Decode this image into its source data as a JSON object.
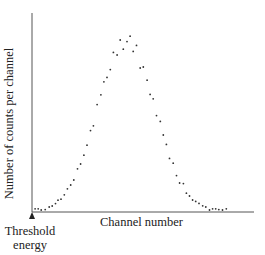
{
  "chart_data": {
    "type": "scatter",
    "title": "",
    "xlabel": "Channel number",
    "ylabel": "Number of counts per channel",
    "annotations": [
      {
        "text": "Threshold energy",
        "position": "x-axis origin",
        "marker": "up-arrow"
      }
    ],
    "grid": false,
    "legend": null,
    "xlim": [
      0,
      100
    ],
    "ylim": [
      0,
      100
    ],
    "x": [
      1.4,
      2.8,
      4.2,
      6.0,
      7.8,
      9.2,
      10.7,
      11.8,
      13.2,
      14.7,
      16.1,
      17.6,
      19.0,
      20.7,
      22.1,
      23.6,
      25.0,
      26.6,
      27.9,
      29.6,
      31.3,
      32.7,
      34.1,
      35.6,
      37.0,
      38.7,
      40.1,
      41.5,
      43.2,
      44.6,
      46.0,
      47.5,
      49.2,
      50.6,
      52.3,
      53.7,
      55.1,
      56.6,
      58.3,
      59.7,
      61.1,
      62.5,
      64.2,
      65.7,
      67.1,
      68.8,
      70.2,
      71.6,
      73.0,
      74.4,
      75.9,
      77.6,
      79.0,
      80.7,
      82.1,
      83.5,
      84.9,
      86.6,
      88.3
    ],
    "y": [
      1.6,
      1.6,
      1.0,
      1.2,
      2.5,
      3.0,
      4.2,
      5.9,
      6.4,
      8.6,
      11.6,
      13.5,
      16.0,
      21.6,
      24.0,
      28.4,
      33.4,
      40.7,
      43.1,
      53.7,
      58.6,
      65.1,
      67.3,
      71.2,
      79.8,
      78.5,
      86.0,
      81.4,
      85.2,
      87.9,
      80.3,
      83.3,
      72.0,
      72.5,
      65.9,
      58.8,
      56.6,
      48.2,
      45.3,
      38.5,
      33.8,
      26.8,
      24.4,
      18.2,
      14.5,
      14.2,
      9.4,
      8.0,
      6.0,
      5.3,
      4.3,
      3.1,
      2.5,
      1.0,
      1.6,
      1.6,
      1.2,
      1.0,
      1.6
    ],
    "series": [
      {
        "name": "counts",
        "marker": "dot"
      }
    ]
  },
  "labels": {
    "y_axis": "Number of counts per channel",
    "x_axis": "Channel number",
    "threshold_line1": "Threshold",
    "threshold_line2": "energy"
  },
  "colors": {
    "axis": "#555555",
    "points": "#333333",
    "text": "#222222"
  }
}
